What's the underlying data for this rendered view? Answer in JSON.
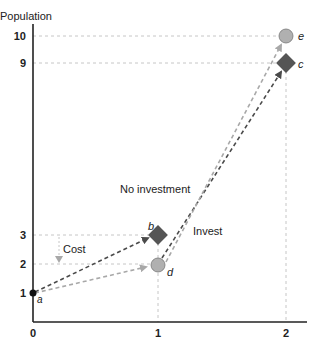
{
  "title": "Population",
  "axes": {
    "ylabel": "Population",
    "y_ticks": [
      "1",
      "2",
      "3",
      "9",
      "10"
    ],
    "x_ticks": [
      "0",
      "1",
      "2"
    ]
  },
  "annotations": {
    "no_investment": "No investment",
    "invest": "Invest",
    "cost": "Cost"
  },
  "points": {
    "a": {
      "label": "a",
      "x": 0,
      "y": 1
    },
    "b": {
      "label": "b",
      "x": 1,
      "y": 3
    },
    "c": {
      "label": "c",
      "x": 2,
      "y": 9
    },
    "d": {
      "label": "d",
      "x": 1,
      "y": 2
    },
    "e": {
      "label": "e",
      "x": 2,
      "y": 10
    }
  },
  "colors": {
    "dark_path": "#4a4a4a",
    "light_path": "#a8a8a8",
    "diamond": "#555555",
    "circle": "#b0b0b0"
  }
}
